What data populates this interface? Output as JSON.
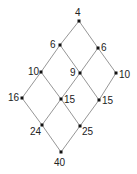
{
  "diagram": {
    "type": "lattice",
    "nodes": [
      {
        "id": "n4",
        "label": "4",
        "x": 79,
        "y": 21,
        "lx": 75,
        "ly": 16
      },
      {
        "id": "n6a",
        "label": "6",
        "x": 60,
        "y": 45,
        "lx": 50,
        "ly": 48
      },
      {
        "id": "n6b",
        "label": "6",
        "x": 98,
        "y": 48,
        "lx": 101,
        "ly": 51
      },
      {
        "id": "n10a",
        "label": "10",
        "x": 41,
        "y": 72,
        "lx": 28,
        "ly": 75
      },
      {
        "id": "n9",
        "label": "9",
        "x": 80,
        "y": 73,
        "lx": 70,
        "ly": 76
      },
      {
        "id": "n10b",
        "label": "10",
        "x": 116,
        "y": 73,
        "lx": 119,
        "ly": 78
      },
      {
        "id": "n16",
        "label": "16",
        "x": 22,
        "y": 98,
        "lx": 8,
        "ly": 101
      },
      {
        "id": "n15a",
        "label": "15",
        "x": 61,
        "y": 99,
        "lx": 64,
        "ly": 103
      },
      {
        "id": "n15b",
        "label": "15",
        "x": 99,
        "y": 100,
        "lx": 102,
        "ly": 104
      },
      {
        "id": "n24",
        "label": "24",
        "x": 42,
        "y": 125,
        "lx": 30,
        "ly": 135
      },
      {
        "id": "n25",
        "label": "25",
        "x": 80,
        "y": 126,
        "lx": 82,
        "ly": 135
      },
      {
        "id": "n40",
        "label": "40",
        "x": 61,
        "y": 152,
        "lx": 54,
        "ly": 166
      }
    ],
    "edges": [
      [
        "n4",
        "n6a"
      ],
      [
        "n4",
        "n6b"
      ],
      [
        "n6a",
        "n10a"
      ],
      [
        "n6a",
        "n9"
      ],
      [
        "n6b",
        "n9"
      ],
      [
        "n6b",
        "n10b"
      ],
      [
        "n10a",
        "n16"
      ],
      [
        "n10a",
        "n15a"
      ],
      [
        "n9",
        "n15a"
      ],
      [
        "n9",
        "n15b"
      ],
      [
        "n10b",
        "n15b"
      ],
      [
        "n16",
        "n24"
      ],
      [
        "n15a",
        "n24"
      ],
      [
        "n15a",
        "n25"
      ],
      [
        "n15b",
        "n25"
      ],
      [
        "n24",
        "n40"
      ],
      [
        "n25",
        "n40"
      ]
    ]
  }
}
